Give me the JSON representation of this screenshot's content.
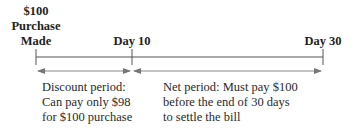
{
  "diagram": {
    "type": "timeline",
    "markers": [
      {
        "lines": [
          "$100",
          "Purchase",
          "Made"
        ],
        "x": 36
      },
      {
        "lines": [
          "Day 10"
        ],
        "x": 132
      },
      {
        "lines": [
          "Day 30"
        ],
        "x": 323
      }
    ],
    "periods": [
      {
        "name": "discount-period",
        "lines": [
          "Discount period:",
          "Can pay only $98",
          "for $100 purchase"
        ]
      },
      {
        "name": "net-period",
        "lines": [
          "Net period: Must pay $100",
          "before the end of 30 days",
          "to settle the bill"
        ]
      }
    ],
    "colors": {
      "line": "#555555",
      "text": "#231f20",
      "arrow": "#777777"
    }
  }
}
